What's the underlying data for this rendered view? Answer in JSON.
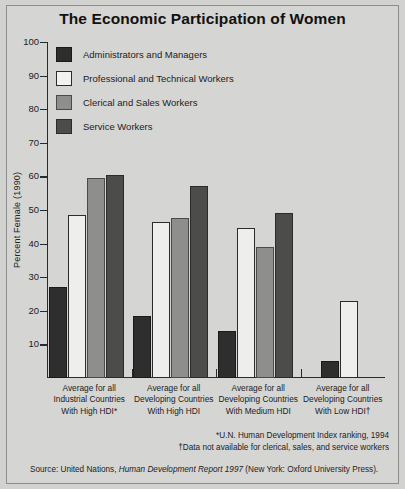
{
  "chart": {
    "title": "The Economic Participation of Women",
    "ylabel": "Percent Female (1990)"
  },
  "legend": {
    "items": [
      {
        "label": "Administrators and Managers",
        "swatch": "dark-solid-swatch"
      },
      {
        "label": "Professional and Technical Workers",
        "swatch": "white-outline-swatch"
      },
      {
        "label": "Clerical and Sales Workers",
        "swatch": "medium-gray-swatch"
      },
      {
        "label": "Service Workers",
        "swatch": "dark-gray-swatch"
      }
    ]
  },
  "axis": {
    "ticklabels": [
      "100",
      "90",
      "80",
      "70",
      "60",
      "50",
      "40",
      "30",
      "20",
      "10"
    ]
  },
  "categories_display": [
    [
      "Average for all",
      "Industrial Countries",
      "With High HDI*"
    ],
    [
      "Average for all",
      "Developing Countries",
      "With High HDI"
    ],
    [
      "Average for all",
      "Developing Countries",
      "With Medium HDI"
    ],
    [
      "Average for all",
      "Developing Countries",
      "With Low HDI†"
    ]
  ],
  "notes": {
    "line1": "*U.N. Human Development Index ranking, 1994",
    "line2": "†Data not available for clerical, sales, and service workers"
  },
  "source": {
    "prefix": "Source: United Nations, ",
    "italic": "Human Development Report 1997",
    "suffix": " (New York: Oxford University Press)."
  },
  "chart_data": {
    "type": "bar",
    "title": "The Economic Participation of Women",
    "xlabel": "",
    "ylabel": "Percent Female (1990)",
    "ylim": [
      0,
      100
    ],
    "yticks": [
      10,
      20,
      30,
      40,
      50,
      60,
      70,
      80,
      90,
      100
    ],
    "grid": false,
    "legend_position": "upper-left-inside",
    "categories": [
      "Average for all Industrial Countries With High HDI*",
      "Average for all Developing Countries With High HDI",
      "Average for all Developing Countries With Medium HDI",
      "Average for all Developing Countries With Low HDI†"
    ],
    "series": [
      {
        "name": "Administrators and Managers",
        "values": [
          27,
          18.5,
          14,
          5
        ]
      },
      {
        "name": "Professional and Technical Workers",
        "values": [
          48.5,
          46.5,
          44.5,
          23
        ]
      },
      {
        "name": "Clerical and Sales Workers",
        "values": [
          59.5,
          47.5,
          39,
          null
        ]
      },
      {
        "name": "Service Workers",
        "values": [
          60.5,
          57,
          49,
          null
        ]
      }
    ],
    "annotations": [
      "*U.N. Human Development Index ranking, 1994",
      "†Data not available for clerical, sales, and service workers",
      "Source: United Nations, Human Development Report 1997 (New York: Oxford University Press)."
    ]
  }
}
